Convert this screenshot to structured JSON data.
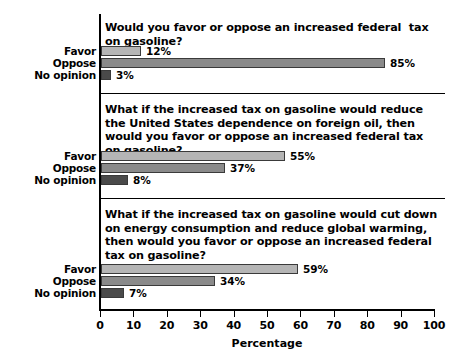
{
  "chart_data": {
    "type": "bar",
    "title": "",
    "xlabel": "Percentage",
    "ylabel": "",
    "xlim": [
      0,
      100
    ],
    "grid": false,
    "legend": null,
    "orientation": "horizontal",
    "categories": [
      "Favor",
      "Oppose",
      "No opinion"
    ],
    "tick_labels": [
      "0",
      "10",
      "20",
      "30",
      "40",
      "50",
      "60",
      "70",
      "80",
      "90",
      "100"
    ],
    "tick_values": [
      0,
      10,
      20,
      30,
      40,
      50,
      60,
      70,
      80,
      90,
      100
    ],
    "panels": [
      {
        "question": "Would you favor or oppose an increased federal  tax on gasoline?",
        "values": [
          12,
          85,
          3
        ],
        "value_labels": [
          "12%",
          "85%",
          "3%"
        ]
      },
      {
        "question": "What if the increased tax on gasoline would reduce the United States dependence on foreign oil, then would you favor or oppose an increased federal tax on gasoline?",
        "values": [
          55,
          37,
          8
        ],
        "value_labels": [
          "55%",
          "37%",
          "8%"
        ]
      },
      {
        "question": "What if the increased tax on gasoline would cut down on energy consumption and reduce global warming, then would you favor or oppose an increased federal tax on gasoline?",
        "values": [
          59,
          34,
          7
        ],
        "value_labels": [
          "59%",
          "34%",
          "7%"
        ]
      }
    ],
    "series_colors": {
      "Favor": "#b5b5b5",
      "Oppose": "#8a8a8a",
      "No opinion": "#4a4a4a"
    },
    "axis_color": "#000000",
    "background": "#ffffff"
  }
}
